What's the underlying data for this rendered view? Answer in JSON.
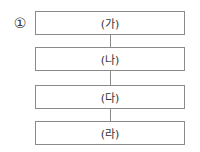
{
  "option_marker": "①",
  "flow": {
    "steps": [
      {
        "label": "(가)"
      },
      {
        "label": "(나)"
      },
      {
        "label": "(다)"
      },
      {
        "label": "(라)"
      }
    ]
  }
}
